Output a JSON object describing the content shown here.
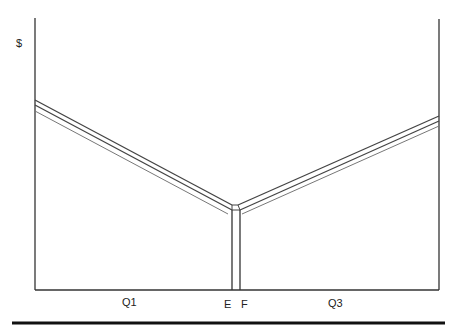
{
  "diagram": {
    "y_axis_label": "$",
    "x_labels": {
      "q1": "Q1",
      "e": "E",
      "f": "F",
      "q3": "Q3"
    },
    "colors": {
      "line": "#333333",
      "thin_line": "#666666",
      "background": "#ffffff"
    }
  }
}
